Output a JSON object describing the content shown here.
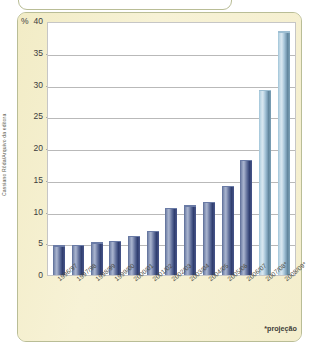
{
  "figure": {
    "credit": "Cassiano Rôda/Arquivo da editora",
    "axis_unit": "%",
    "footnote": "*projeção"
  },
  "chart_data": {
    "type": "bar",
    "title": "",
    "xlabel": "",
    "ylabel": "%",
    "ylim": [
      0,
      40
    ],
    "yticks": [
      0,
      5,
      10,
      15,
      20,
      25,
      30,
      35,
      40
    ],
    "ytick_labels": [
      "0",
      "5",
      "10",
      "15",
      "20",
      "25",
      "30",
      "35",
      "40"
    ],
    "grid": true,
    "legend": false,
    "categories": [
      "1996/97",
      "1997/98",
      "1998/99",
      "1999/00",
      "2000/01",
      "2001/02",
      "2002/03",
      "2003/04",
      "2004/05",
      "2005/06",
      "2006/07",
      "2007/08*",
      "2008/09*"
    ],
    "values": [
      4.5,
      4.6,
      5.0,
      5.2,
      6.0,
      6.8,
      10.4,
      10.8,
      11.4,
      13.9,
      18.0,
      29.0,
      38.2
    ],
    "point_colors": [
      "#6f7da5",
      "#6f7da5",
      "#6f7da5",
      "#6f7da5",
      "#6f7da5",
      "#6f7da5",
      "#6f7da5",
      "#6f7da5",
      "#6f7da5",
      "#6f7da5",
      "#6f7da5",
      "#a8c8dc",
      "#a8c8dc"
    ],
    "projection_indices": [
      11,
      12
    ],
    "annotations": [
      "*projeção"
    ],
    "colors": {
      "bar": "#6f7da5",
      "bar_projection": "#a8c8dc",
      "panel_background": "#f4eecd",
      "plot_background": "#ffffff",
      "gridline": "#b9b9b9",
      "frame": "#b9bd96"
    }
  }
}
